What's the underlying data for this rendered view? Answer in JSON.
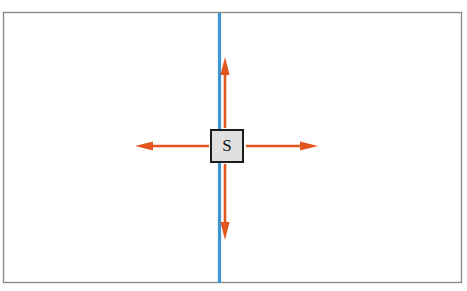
{
  "figure": {
    "name": "point-source-wavefront-diagram",
    "background_color": "#ffffff",
    "frame": {
      "name": "outer-frame",
      "x": 3.5,
      "y": 12.5,
      "width": 458,
      "height": 270,
      "stroke_color": "#8a8a86",
      "stroke_width": 1.4,
      "fill_color": "#ffffff"
    },
    "vertical_line": {
      "name": "blue-vertical-line",
      "x": 219.5,
      "y_top": 13,
      "y_bottom": 283,
      "color": "#3f95d2",
      "width": 3.2
    },
    "source_box": {
      "name": "source-box",
      "label": "S",
      "x": 211,
      "y": 130,
      "width": 32,
      "height": 32,
      "fill_color": "#e0e0e0",
      "stroke_color": "#1b1b1b",
      "stroke_width": 2,
      "label_color": "#111111",
      "center_x": 227,
      "center_y": 146
    },
    "arrows": {
      "color": "#e2571e",
      "shaft_width": 2.6,
      "items": [
        {
          "name": "arrow-up",
          "direction": "up",
          "x1": 225,
          "y1": 128,
          "x2": 225,
          "y2": 57
        },
        {
          "name": "arrow-down",
          "direction": "down",
          "x1": 225,
          "y1": 164,
          "x2": 225,
          "y2": 240
        },
        {
          "name": "arrow-left",
          "direction": "left",
          "x1": 209,
          "y1": 146,
          "x2": 135,
          "y2": 146
        },
        {
          "name": "arrow-right",
          "direction": "right",
          "x1": 246,
          "y1": 146,
          "x2": 318,
          "y2": 146
        }
      ]
    }
  }
}
